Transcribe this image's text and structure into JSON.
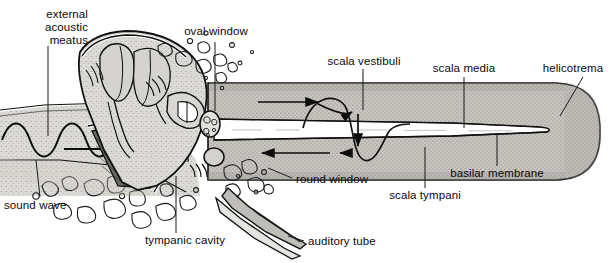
{
  "figure": {
    "type": "anatomical-diagram",
    "background_color": "#ffffff",
    "ink_color": "#111111",
    "fill_tones": {
      "bone_light": "#d8d6d2",
      "bone_mid": "#c2c0bb",
      "perilymph_gray": "#b4b2ad",
      "cochlear_duct_white": "#ffffff",
      "tympanic_membrane_dark": "#6e6c68",
      "stipple": "#7d7b77"
    }
  },
  "labels": [
    {
      "id": "external-acoustic-meatus",
      "text": "external\nacoustic\nmeatus",
      "align": "right",
      "x": 10,
      "y": 8
    },
    {
      "id": "oval-window",
      "text": "oval window",
      "align": "center",
      "x": 188,
      "y": 29
    },
    {
      "id": "scala-vestibuli",
      "text": "scala vestibuli",
      "align": "center",
      "x": 322,
      "y": 57
    },
    {
      "id": "scala-media",
      "text": "scala media",
      "align": "center",
      "x": 426,
      "y": 64
    },
    {
      "id": "helicotrema",
      "text": "helicotrema",
      "align": "center",
      "x": 533,
      "y": 64
    },
    {
      "id": "basilar-membrane",
      "text": "basilar membrane",
      "align": "center",
      "x": 446,
      "y": 170
    },
    {
      "id": "scala-tympani",
      "text": "scala tympani",
      "align": "center",
      "x": 381,
      "y": 192
    },
    {
      "id": "round-window",
      "text": "round window",
      "align": "left",
      "x": 295,
      "y": 173
    },
    {
      "id": "auditory-tube",
      "text": "auditory tube",
      "align": "left",
      "x": 307,
      "y": 237
    },
    {
      "id": "tympanic-cavity",
      "text": "tympanic cavity",
      "align": "left",
      "x": 146,
      "y": 236
    },
    {
      "id": "sound-wave",
      "text": "sound wave",
      "align": "left",
      "x": 5,
      "y": 200
    }
  ],
  "structures": [
    {
      "id": "external-acoustic-meatus",
      "name": "external acoustic meatus"
    },
    {
      "id": "tympanic-membrane",
      "name": "tympanic membrane"
    },
    {
      "id": "auditory-ossicles",
      "name": "auditory ossicles (malleus, incus, stapes)"
    },
    {
      "id": "tympanic-cavity",
      "name": "tympanic cavity"
    },
    {
      "id": "oval-window",
      "name": "oval window"
    },
    {
      "id": "round-window",
      "name": "round window"
    },
    {
      "id": "auditory-tube",
      "name": "auditory tube"
    },
    {
      "id": "scala-vestibuli",
      "name": "scala vestibuli"
    },
    {
      "id": "scala-media",
      "name": "scala media (cochlear duct)"
    },
    {
      "id": "scala-tympani",
      "name": "scala tympani"
    },
    {
      "id": "basilar-membrane",
      "name": "basilar membrane"
    },
    {
      "id": "helicotrema",
      "name": "helicotrema"
    },
    {
      "id": "temporal-bone",
      "name": "temporal bone (trabecular)"
    }
  ],
  "flow_arrows": [
    {
      "id": "sound-wave-arrow",
      "direction": "right",
      "region": "external acoustic meatus"
    },
    {
      "id": "scala-vestibuli-arrow-1",
      "direction": "right",
      "region": "scala vestibuli"
    },
    {
      "id": "scala-vestibuli-arrow-2",
      "direction": "right",
      "region": "scala vestibuli"
    },
    {
      "id": "basilar-displacement-arrow",
      "direction": "down",
      "region": "basilar membrane"
    },
    {
      "id": "scala-tympani-arrow-1",
      "direction": "left",
      "region": "scala tympani"
    },
    {
      "id": "scala-tympani-arrow-2",
      "direction": "left",
      "region": "scala tympani"
    }
  ]
}
